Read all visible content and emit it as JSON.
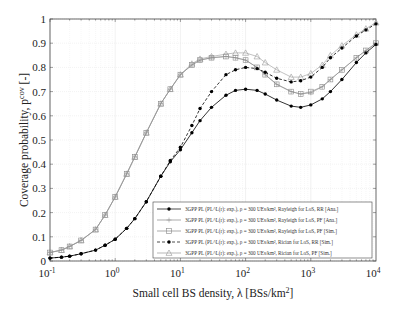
{
  "chart_data": {
    "type": "line",
    "title": "",
    "xlabel": "Small cell BS density, λ [BSs/km²]",
    "ylabel": "Coverage probability, p^cov [-]",
    "xscale": "log",
    "xlim": [
      0.1,
      10000
    ],
    "ylim": [
      0,
      1
    ],
    "grid": true,
    "legend_position": "lower right",
    "x_ticks": [
      "10^-1",
      "10^0",
      "10^1",
      "10^2",
      "10^3",
      "10^4"
    ],
    "x_tick_values": [
      0.1,
      1,
      10,
      100,
      1000,
      10000
    ],
    "y_ticks": [
      "0",
      "0.1",
      "0.2",
      "0.3",
      "0.4",
      "0.5",
      "0.6",
      "0.7",
      "0.8",
      "0.9",
      "1"
    ],
    "y_tick_values": [
      0,
      0.1,
      0.2,
      0.3,
      0.4,
      0.5,
      0.6,
      0.7,
      0.8,
      0.9,
      1.0
    ],
    "x": [
      0.1,
      0.15,
      0.2,
      0.3,
      0.5,
      0.7,
      1,
      1.5,
      2,
      3,
      5,
      7,
      10,
      15,
      20,
      30,
      50,
      70,
      100,
      150,
      200,
      300,
      500,
      700,
      1000,
      1500,
      2000,
      3000,
      5000,
      7000,
      10000
    ],
    "series": [
      {
        "name": "3GPP PL (PL^L(r): exp.), ρ = 300 UEs/km², Rayleigh for LoS, RR [Ana.]",
        "style": "solid",
        "marker": "filled-circle",
        "color": "#000000",
        "values": [
          0.012,
          0.016,
          0.02,
          0.03,
          0.045,
          0.065,
          0.09,
          0.135,
          0.175,
          0.245,
          0.35,
          0.41,
          0.46,
          0.53,
          0.58,
          0.635,
          0.685,
          0.705,
          0.71,
          0.705,
          0.69,
          0.665,
          0.64,
          0.635,
          0.645,
          0.67,
          0.7,
          0.75,
          0.82,
          0.86,
          0.895
        ]
      },
      {
        "name": "3GPP PL (PL^L(r): exp.), ρ = 300 UEs/km², Rayleigh for LoS, PF [Ana.]",
        "style": "solid",
        "marker": "plus",
        "color": "#888888",
        "values": [
          0.035,
          0.045,
          0.06,
          0.085,
          0.13,
          0.19,
          0.265,
          0.36,
          0.43,
          0.53,
          0.65,
          0.71,
          0.77,
          0.81,
          0.83,
          0.84,
          0.845,
          0.84,
          0.83,
          0.8,
          0.77,
          0.73,
          0.7,
          0.69,
          0.695,
          0.72,
          0.75,
          0.79,
          0.84,
          0.87,
          0.9
        ]
      },
      {
        "name": "3GPP PL (PL^L(r): exp.), ρ = 300 UEs/km², Rayleigh for LoS, PF [Sim.]",
        "style": "solid",
        "marker": "square",
        "color": "#888888",
        "values": [
          0.035,
          0.045,
          0.06,
          0.085,
          0.13,
          0.19,
          0.265,
          0.36,
          0.43,
          0.53,
          0.65,
          0.71,
          0.77,
          0.81,
          0.83,
          0.84,
          0.845,
          0.84,
          0.83,
          0.8,
          0.77,
          0.73,
          0.7,
          0.69,
          0.7,
          0.72,
          0.75,
          0.79,
          0.84,
          0.87,
          0.9
        ]
      },
      {
        "name": "3GPP PL (PL^L(r): exp.), ρ = 300 UEs/km², Rician for LoS, RR [Sim.]",
        "style": "dashed",
        "marker": "filled-circle",
        "color": "#000000",
        "values": [
          0.012,
          0.016,
          0.02,
          0.03,
          0.045,
          0.065,
          0.09,
          0.135,
          0.175,
          0.245,
          0.35,
          0.415,
          0.47,
          0.56,
          0.63,
          0.7,
          0.77,
          0.79,
          0.8,
          0.795,
          0.78,
          0.755,
          0.74,
          0.745,
          0.76,
          0.8,
          0.84,
          0.88,
          0.93,
          0.955,
          0.98
        ]
      },
      {
        "name": "3GPP PL (PL^L(r): exp.), ρ = 300 UEs/km², Rician for LoS, PF [Sim.]",
        "style": "solid",
        "marker": "triangle",
        "color": "#999999",
        "values": [
          0.035,
          0.045,
          0.06,
          0.085,
          0.13,
          0.19,
          0.265,
          0.36,
          0.43,
          0.53,
          0.65,
          0.71,
          0.77,
          0.815,
          0.835,
          0.845,
          0.855,
          0.86,
          0.86,
          0.845,
          0.82,
          0.79,
          0.76,
          0.76,
          0.775,
          0.81,
          0.85,
          0.89,
          0.935,
          0.96,
          0.985
        ]
      }
    ]
  },
  "legend": {
    "items": [
      {
        "label": "3GPP PL (PL^L(r): exp.), ρ = 300 UEs/km², Rayleigh for LoS, RR [Ana.]"
      },
      {
        "label": "3GPP PL (PL^L(r): exp.), ρ = 300 UEs/km², Rayleigh for LoS, PF [Ana.]"
      },
      {
        "label": "3GPP PL (PL^L(r): exp.), ρ = 300 UEs/km², Rayleigh for LoS, PF [Sim.]"
      },
      {
        "label": "3GPP PL (PL^L(r): exp.), ρ = 300 UEs/km², Rician for LoS, RR [Sim.]"
      },
      {
        "label": "3GPP PL (PL^L(r): exp.), ρ = 300 UEs/km², Rician for LoS, PF [Sim.]"
      }
    ]
  },
  "axes": {
    "xlabel_main": "Small cell BS density, λ [BSs/km",
    "xlabel_sup": "2",
    "xlabel_tail": "]",
    "ylabel_main": "Coverage probability, p",
    "ylabel_sup": "cov",
    "ylabel_tail": " [-]"
  }
}
